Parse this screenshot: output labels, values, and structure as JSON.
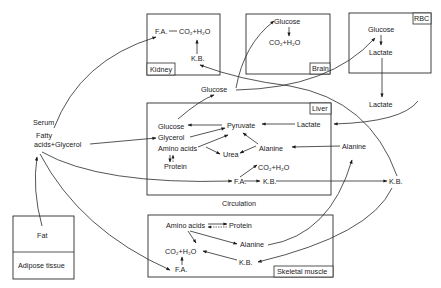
{
  "diagram": {
    "organs": {
      "kidney": {
        "label": "Kidney",
        "nodes": {
          "fa": "F.A.",
          "co2": "CO₂+H₂O",
          "kb": "K.B."
        }
      },
      "brain": {
        "label": "Brain",
        "nodes": {
          "glucose": "Glucose",
          "co2": "CO₂+H₂O"
        }
      },
      "rbc": {
        "label": "RBC",
        "nodes": {
          "glucose": "Glucose",
          "lactate": "Lactate"
        }
      },
      "liver": {
        "label": "Liver",
        "nodes": {
          "glucose": "Glucose",
          "glycerol": "Glycerol",
          "amino_acids": "Amino acids",
          "protein": "Protein",
          "pyruvate": "Pyruvate",
          "urea": "Urea",
          "alanine": "Alanine",
          "lactate": "Lactate",
          "co2": "CO₂+H₂O",
          "fa": "F.A.",
          "kb": "K.B."
        }
      },
      "adipose": {
        "label": "Adipose tissue",
        "nodes": {
          "fat": "Fat"
        }
      },
      "muscle": {
        "label": "Skeletal muscle",
        "nodes": {
          "amino_acids": "Amino acids",
          "protein": "Protein",
          "alanine": "Alanine",
          "co2": "CO₂+H₂O",
          "fa": "F.A.",
          "kb": "K.B."
        }
      }
    },
    "serum": {
      "serum": "Serum",
      "fatty": "Fatty",
      "acids_glycerol": "acids+Glycerol"
    },
    "circulation": {
      "label": "Circulation",
      "glucose": "Glucose",
      "lactate": "Lactate",
      "alanine": "Alanine",
      "kb": "K.B."
    }
  }
}
